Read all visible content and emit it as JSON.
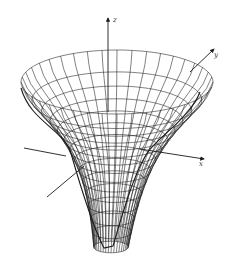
{
  "chart_data": {
    "type": "surface",
    "title": "",
    "axes": {
      "x_label": "x",
      "y_label": "y",
      "z_label": "z"
    },
    "surface": {
      "function": "z = -1/sqrt(x^2 + y^2)",
      "radial_lines": 40,
      "rings": 14,
      "r_min": 0.18,
      "r_max": 1.0
    },
    "grid": false,
    "legend": null,
    "ticks": []
  },
  "colors": {
    "line": "#1a1a1a",
    "background": "#ffffff"
  }
}
